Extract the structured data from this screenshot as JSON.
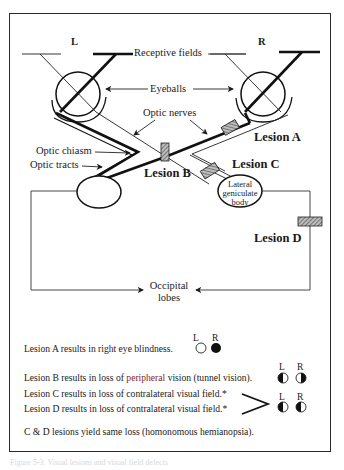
{
  "diagram": {
    "eye_labels": {
      "left": "L",
      "right": "R"
    },
    "labels": {
      "receptive_fields": "Receptive fields",
      "eyeballs": "Eyeballs",
      "optic_nerves": "Optic nerves",
      "optic_chiasm": "Optic chiasm",
      "optic_tracts": "Optic tracts",
      "lateral_geniculate_body": [
        "Lateral",
        "geniculate",
        "body"
      ],
      "occipital_lobes": [
        "Occipital",
        "lobes"
      ]
    },
    "lesions": {
      "a": "Lesion A",
      "b": "Lesion B",
      "c": "Lesion C",
      "d": "Lesion D"
    }
  },
  "legend": {
    "col_l": "L",
    "col_r": "R",
    "rows": [
      {
        "text": "Lesion A results in right eye blindness.",
        "left_field": "empty-circle",
        "right_field": "filled-circle"
      },
      {
        "text_before": "Lesion B results in loss of ",
        "text_highlight": "peripheral",
        "text_after": " vision (tunnel vision).",
        "left_field": "left-half-filled",
        "right_field": "right-half-filled"
      },
      {
        "text": "Lesion C results in loss of contralateral visual field.*"
      },
      {
        "text": "Lesion D results in loss of contralateral visual field.*",
        "left_field": "left-half-filled",
        "right_field": "left-half-filled"
      }
    ],
    "note": "C & D lesions yield same loss (homonomous hemianopsia)."
  },
  "caption": "Figure 5-3. Visual lesions and visual field defects"
}
